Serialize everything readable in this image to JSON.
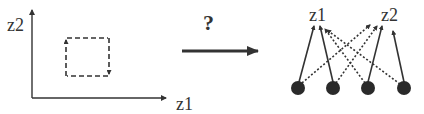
{
  "left_panel": {
    "x_axis_label": "z1",
    "y_axis_label": "z2",
    "region": "dashed-cycle-square"
  },
  "middle": {
    "question_mark": "?",
    "arrow": "right-arrow"
  },
  "right_panel": {
    "output_labels": [
      "z1",
      "z2"
    ],
    "input_node_count": 4,
    "connections": [
      {
        "from": 1,
        "to": "z1",
        "style": "solid"
      },
      {
        "from": 1,
        "to": "z2",
        "style": "dotted"
      },
      {
        "from": 2,
        "to": "z1",
        "style": "solid"
      },
      {
        "from": 2,
        "to": "z2",
        "style": "dotted"
      },
      {
        "from": 3,
        "to": "z2",
        "style": "solid"
      },
      {
        "from": 3,
        "to": "z1",
        "style": "dotted"
      },
      {
        "from": 4,
        "to": "z2",
        "style": "solid"
      },
      {
        "from": 4,
        "to": "z1",
        "style": "dotted"
      }
    ]
  },
  "colors": {
    "ink": "#333333",
    "node": "#2a2a2a",
    "background": "#ffffff"
  }
}
